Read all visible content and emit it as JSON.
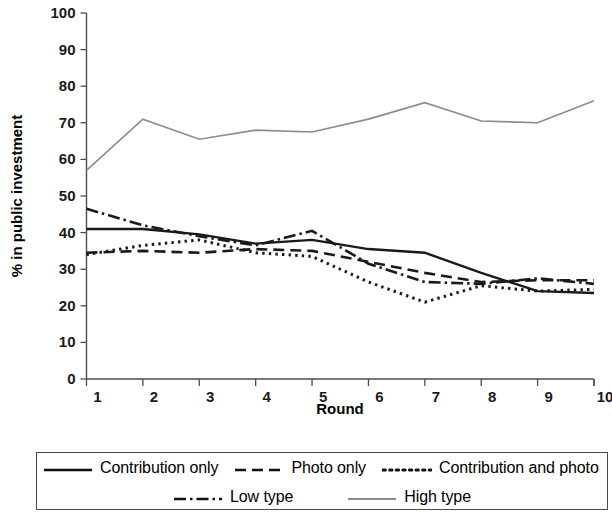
{
  "chart_data": {
    "type": "line",
    "title": "",
    "xlabel": "Round",
    "ylabel": "% in public investment",
    "categories": [
      "1",
      "2",
      "3",
      "4",
      "5",
      "6",
      "7",
      "8",
      "9",
      "10"
    ],
    "x": [
      1,
      2,
      3,
      4,
      5,
      6,
      7,
      8,
      9,
      10
    ],
    "ylim": [
      0,
      100
    ],
    "xlim": [
      1,
      10
    ],
    "yticks": [
      "0",
      "10",
      "20",
      "30",
      "40",
      "50",
      "60",
      "70",
      "80",
      "90",
      "100"
    ],
    "ytick_values": [
      0,
      10,
      20,
      30,
      40,
      50,
      60,
      70,
      80,
      90,
      100
    ],
    "grid": false,
    "legend_position": "bottom",
    "series": [
      {
        "name": "Contribution only",
        "style": "solid",
        "color": "#1a1a1a",
        "values": [
          41.0,
          41.0,
          39.5,
          37.0,
          38.0,
          35.5,
          34.5,
          29.0,
          24.0,
          23.5
        ]
      },
      {
        "name": "Photo only",
        "style": "dashed",
        "color": "#1a1a1a",
        "values": [
          34.5,
          35.0,
          34.5,
          35.5,
          35.0,
          32.0,
          29.0,
          26.5,
          27.0,
          27.0
        ]
      },
      {
        "name": "Contribution and photo",
        "style": "dotted",
        "color": "#1a1a1a",
        "values": [
          34.0,
          36.5,
          38.0,
          34.5,
          33.5,
          26.5,
          21.0,
          25.5,
          24.0,
          24.5
        ]
      },
      {
        "name": "Low type",
        "style": "dash-dot",
        "color": "#1a1a1a",
        "values": [
          46.5,
          42.0,
          39.0,
          36.5,
          40.5,
          31.5,
          26.5,
          26.0,
          27.5,
          26.0
        ]
      },
      {
        "name": "High type",
        "style": "solid-gray",
        "color": "#8c8c8c",
        "values": [
          57.0,
          71.0,
          65.5,
          68.0,
          67.5,
          71.0,
          75.5,
          70.5,
          70.0,
          76.0
        ]
      }
    ]
  },
  "axis": {
    "x_title": "Round",
    "y_title": "% in public investment",
    "x_tick_labels": [
      "1",
      "2",
      "3",
      "4",
      "5",
      "6",
      "7",
      "8",
      "9",
      "10"
    ],
    "y_tick_labels": [
      "100",
      "90",
      "80",
      "70",
      "60",
      "50",
      "40",
      "30",
      "20",
      "10",
      "0"
    ]
  },
  "legend": {
    "row1": [
      {
        "label": "Contribution only",
        "style": "solid"
      },
      {
        "label": "Photo only",
        "style": "dashed"
      },
      {
        "label": "Contribution and photo",
        "style": "dotted"
      }
    ],
    "row2": [
      {
        "label": "Low type",
        "style": "dash-dot"
      },
      {
        "label": "High type",
        "style": "solid-gray"
      }
    ]
  }
}
